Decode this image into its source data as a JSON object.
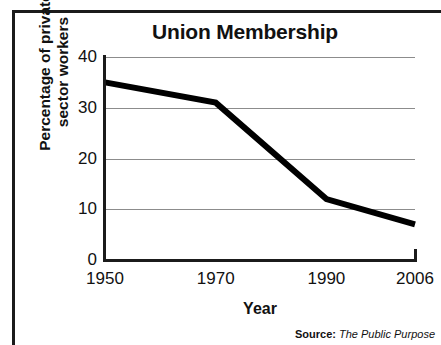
{
  "chart_data": {
    "type": "line",
    "title": "Union Membership",
    "xlabel": "Year",
    "ylabel": "Percentage of private\nsector workers",
    "x": [
      1950,
      1970,
      1990,
      2006
    ],
    "categories": [
      "1950",
      "1970",
      "1990",
      "2006"
    ],
    "values": [
      35,
      31,
      12,
      7
    ],
    "series": [
      {
        "name": "Percentage of private sector workers",
        "values": [
          35,
          31,
          12,
          7
        ],
        "color": "#000000"
      }
    ],
    "xlim": [
      1950,
      2006
    ],
    "ylim": [
      0,
      40
    ],
    "yticks": [
      0,
      10,
      20,
      30,
      40
    ],
    "ytick_labels": [
      "0",
      "10",
      "20",
      "30",
      "40"
    ],
    "xticks": [
      1950,
      1970,
      1990,
      2006
    ],
    "xtick_labels": [
      "1950",
      "1970",
      "1990",
      "2006"
    ],
    "grid": "horizontal",
    "gridline_color": "#8c8c8c",
    "axis_color": "#1b1b1b",
    "legend": "none"
  },
  "source": {
    "label": "Source:",
    "value": "The Public Purpose"
  }
}
